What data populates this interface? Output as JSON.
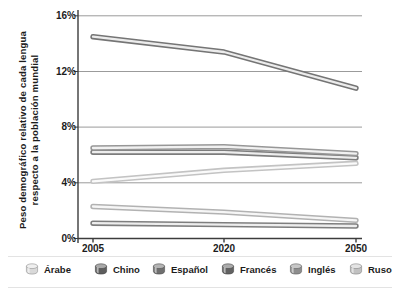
{
  "figure": {
    "y_axis_label_line1": "Peso demográfico relativo de cada lengua",
    "y_axis_label_line2": "respecto a la población mundial"
  },
  "chart_data": {
    "type": "line",
    "title": "",
    "xlabel": "",
    "ylabel": "Peso demográfico relativo de cada lengua respecto a la población mundial",
    "categories": [
      "2005",
      "2020",
      "2050"
    ],
    "y_ticks": [
      "16%",
      "12%",
      "8%",
      "4%",
      "0%"
    ],
    "y_tick_values": [
      16,
      12,
      8,
      4,
      0
    ],
    "ylim": [
      0,
      16
    ],
    "grid": "horizontal",
    "legend_position": "bottom",
    "line_style": "outlined-tube",
    "series": [
      {
        "name": "Chino",
        "values": [
          14.5,
          13.4,
          10.8
        ],
        "edge_color": "#757575",
        "core_color": "#ececec"
      },
      {
        "name": "Inglés",
        "values": [
          6.5,
          6.6,
          6.1
        ],
        "edge_color": "#979797",
        "core_color": "#f1f1f1"
      },
      {
        "name": "Español",
        "values": [
          6.2,
          6.2,
          5.8
        ],
        "edge_color": "#7d7d7d",
        "core_color": "#ededed"
      },
      {
        "name": "Árabe",
        "values": [
          4.1,
          4.9,
          5.4
        ],
        "edge_color": "#c3c3c3",
        "core_color": "#fafafa"
      },
      {
        "name": "Ruso",
        "values": [
          2.3,
          1.9,
          1.3
        ],
        "edge_color": "#b2b2b2",
        "core_color": "#f6f6f6"
      },
      {
        "name": "Francés",
        "values": [
          1.1,
          1.0,
          0.9
        ],
        "edge_color": "#7e7e7e",
        "core_color": "#ededed"
      }
    ],
    "draw_order": [
      "Árabe",
      "Ruso",
      "Francés",
      "Español",
      "Inglés",
      "Chino"
    ]
  },
  "legend": {
    "items": [
      {
        "label": "Árabe",
        "body_color": "#d9d9d9",
        "top_color": "#efefef",
        "outline_color": "#8a8a8a"
      },
      {
        "label": "Chino",
        "body_color": "#5d5d5d",
        "top_color": "#a9a9a9",
        "outline_color": "#3f3f3f"
      },
      {
        "label": "Español",
        "body_color": "#6f6f6f",
        "top_color": "#b4b4b4",
        "outline_color": "#474747"
      },
      {
        "label": "Francés",
        "body_color": "#626262",
        "top_color": "#ababab",
        "outline_color": "#414141"
      },
      {
        "label": "Inglés",
        "body_color": "#8d8d8d",
        "top_color": "#c7c7c7",
        "outline_color": "#5a5a5a"
      },
      {
        "label": "Ruso",
        "body_color": "#c1c1c1",
        "top_color": "#e4e4e4",
        "outline_color": "#7e7e7e"
      }
    ]
  }
}
